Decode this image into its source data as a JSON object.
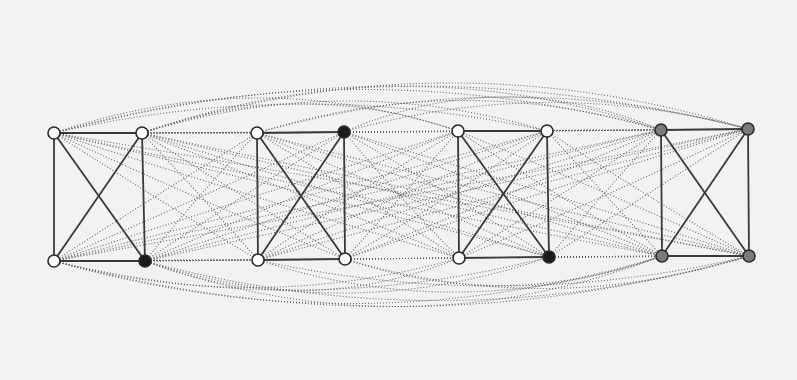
{
  "diagram": {
    "type": "graph",
    "colors": {
      "background": "#f2f2f0",
      "white_node": "#ffffff",
      "black_node": "#1a1a1a",
      "gray_node": "#7a7a7a",
      "edge": "#3a3a3a"
    },
    "groups": [
      {
        "id": "g1",
        "nodes": [
          {
            "id": "g1-tl",
            "x": 54,
            "y": 133,
            "fill": "white"
          },
          {
            "id": "g1-tr",
            "x": 142,
            "y": 133,
            "fill": "white"
          },
          {
            "id": "g1-bl",
            "x": 54,
            "y": 261,
            "fill": "white"
          },
          {
            "id": "g1-br",
            "x": 145,
            "y": 261,
            "fill": "black"
          }
        ]
      },
      {
        "id": "g2",
        "nodes": [
          {
            "id": "g2-tl",
            "x": 257,
            "y": 133,
            "fill": "white"
          },
          {
            "id": "g2-tr",
            "x": 344,
            "y": 132,
            "fill": "black"
          },
          {
            "id": "g2-bl",
            "x": 258,
            "y": 260,
            "fill": "white"
          },
          {
            "id": "g2-br",
            "x": 345,
            "y": 259,
            "fill": "white"
          }
        ]
      },
      {
        "id": "g3",
        "nodes": [
          {
            "id": "g3-tl",
            "x": 458,
            "y": 131,
            "fill": "white"
          },
          {
            "id": "g3-tr",
            "x": 547,
            "y": 131,
            "fill": "white"
          },
          {
            "id": "g3-bl",
            "x": 459,
            "y": 258,
            "fill": "white"
          },
          {
            "id": "g3-br",
            "x": 549,
            "y": 257,
            "fill": "black"
          }
        ]
      },
      {
        "id": "g4",
        "nodes": [
          {
            "id": "g4-tl",
            "x": 661,
            "y": 130,
            "fill": "gray"
          },
          {
            "id": "g4-tr",
            "x": 748,
            "y": 129,
            "fill": "gray"
          },
          {
            "id": "g4-bl",
            "x": 662,
            "y": 256,
            "fill": "gray"
          },
          {
            "id": "g4-br",
            "x": 749,
            "y": 256,
            "fill": "gray"
          }
        ]
      }
    ],
    "solid_edges_note": "Each group is a complete graph K4: 4 sides + 2 diagonals",
    "dotted_edges_note": "Dotted edges connect nodes across different groups; long-range connections drawn as curved arcs above and below"
  }
}
